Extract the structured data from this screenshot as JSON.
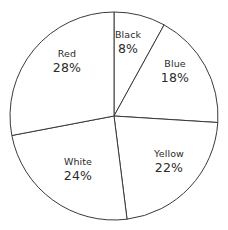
{
  "chart_data": {
    "type": "pie",
    "title": "",
    "subtitle": "",
    "xlabel": "",
    "ylabel": "",
    "legend_position": "none",
    "grid": false,
    "units": "percent",
    "start_angle_deg": 0,
    "direction": "clockwise",
    "categories": [
      "Black",
      "Blue",
      "Yellow",
      "White",
      "Red"
    ],
    "values": [
      8,
      18,
      22,
      24,
      28
    ],
    "total": 100,
    "slices": [
      {
        "label": "Black",
        "value": 8,
        "value_text": "8%",
        "start_deg": 0,
        "end_deg": 28.8,
        "label_x": 128,
        "label_y": 43,
        "fill": "#ffffff",
        "stroke": "#3a3a3a"
      },
      {
        "label": "Blue",
        "value": 18,
        "value_text": "18%",
        "start_deg": 28.8,
        "end_deg": 93.6,
        "label_x": 175,
        "label_y": 72,
        "fill": "#ffffff",
        "stroke": "#3a3a3a"
      },
      {
        "label": "Yellow",
        "value": 22,
        "value_text": "22%",
        "start_deg": 93.6,
        "end_deg": 172.8,
        "label_x": 169,
        "label_y": 162,
        "fill": "#ffffff",
        "stroke": "#3a3a3a"
      },
      {
        "label": "White",
        "value": 24,
        "value_text": "24%",
        "start_deg": 172.8,
        "end_deg": 259.2,
        "label_x": 78,
        "label_y": 170,
        "fill": "#ffffff",
        "stroke": "#3a3a3a"
      },
      {
        "label": "Red",
        "value": 28,
        "value_text": "28%",
        "start_deg": 259.2,
        "end_deg": 360,
        "label_x": 67,
        "label_y": 62,
        "fill": "#ffffff",
        "stroke": "#3a3a3a"
      }
    ],
    "geometry": {
      "center_x": 114,
      "center_y": 116,
      "radius": 104
    }
  }
}
